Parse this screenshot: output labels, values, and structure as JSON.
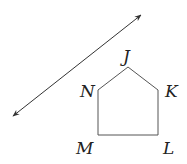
{
  "diagram": {
    "type": "geometry",
    "line": {
      "start": [
        13,
        116
      ],
      "end": [
        141,
        15
      ],
      "arrows": "both",
      "color": "#333333"
    },
    "pentagon": {
      "vertices": [
        {
          "label": "J",
          "x": 128,
          "y": 67,
          "label_x": 123,
          "label_y": 62
        },
        {
          "label": "K",
          "x": 158,
          "y": 90,
          "label_x": 165,
          "label_y": 97
        },
        {
          "label": "L",
          "x": 158,
          "y": 135,
          "label_x": 163,
          "label_y": 154
        },
        {
          "label": "M",
          "x": 98,
          "y": 135,
          "label_x": 76,
          "label_y": 154
        },
        {
          "label": "N",
          "x": 98,
          "y": 90,
          "label_x": 80,
          "label_y": 97
        }
      ],
      "stroke": "#555555"
    }
  }
}
